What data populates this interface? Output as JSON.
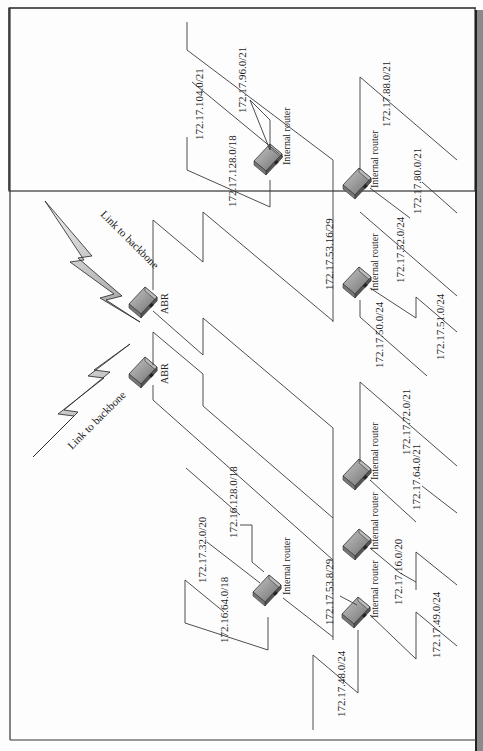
{
  "diagram": {
    "orientation": "rotated-90",
    "backbone_links": [
      {
        "id": "link1",
        "label": "Link to backbone"
      },
      {
        "id": "link2",
        "label": "Link to backbone"
      }
    ],
    "abr_routers": [
      {
        "id": "abr1",
        "label": "ABR"
      },
      {
        "id": "abr2",
        "label": "ABR"
      }
    ],
    "transit_networks": [
      {
        "id": "t16",
        "label": "172.17.53.16/29"
      },
      {
        "id": "t8",
        "label": "172.17.53.8/29"
      }
    ],
    "internal_routers": [
      {
        "id": "ir1",
        "label": "Internal router"
      },
      {
        "id": "ir2",
        "label": "Internal router"
      },
      {
        "id": "ir3",
        "label": "Internal router"
      },
      {
        "id": "ir4",
        "label": "Internal router"
      },
      {
        "id": "ir5",
        "label": "Internal router"
      },
      {
        "id": "ir6",
        "label": "Internal router"
      },
      {
        "id": "ir7",
        "label": "Internal router"
      }
    ],
    "subnets": {
      "s_104": "172.17.104.0/21",
      "s_96": "172.17.96.0/21",
      "s_128_18": "172.17.128.0/18",
      "s_88": "172.17.88.0/21",
      "s_80": "172.17.80.0/21",
      "s_52": "172.17.52.0/24",
      "s_50": "172.17.50.0/24",
      "s_51": "172.17.51.0/24",
      "s_72": "172.17.72.0/21",
      "s_64": "172.17.64.0/21",
      "s_16_20": "172.17.16.0/20",
      "s_49": "172.17.49.0/24",
      "s_48": "172.17.48.0/24",
      "s_32_20": "172.17.32.0/20",
      "s_16_128": "172.16.128.0/18",
      "s_16_64": "172.16.64.0/18"
    },
    "colors": {
      "line": "#3a3a3a",
      "border": "#333333",
      "sidebar": "#8a8a8a",
      "router_body": "#8c8c8c",
      "router_top": "#b5b5b5"
    }
  }
}
